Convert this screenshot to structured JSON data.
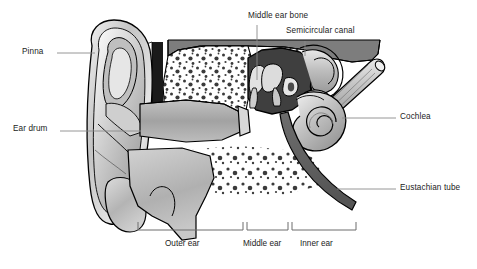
{
  "diagram": {
    "style": "grayscale anatomical illustration",
    "colors": {
      "outline": "#000000",
      "cranial_band": "#7d7d7d",
      "bone_fill": "#ffffff",
      "tissue_light": "#c9c9c9",
      "tissue_mid": "#a8a8a8",
      "cavity_dark": "#4a4a4a",
      "leader_line": "#8a8a8a",
      "text": "#1b1b1b",
      "background": "#ffffff"
    },
    "labels": [
      {
        "id": "pinna",
        "text": "Pinna",
        "x": 22,
        "y": 48,
        "anchor": "left"
      },
      {
        "id": "ear-drum",
        "text": "Ear drum",
        "x": 13,
        "y": 125,
        "anchor": "left"
      },
      {
        "id": "middle-ear-bone",
        "text": "Middle ear bone",
        "x": 248,
        "y": 12,
        "anchor": "top"
      },
      {
        "id": "semicircular-canal",
        "text": "Semicircular canal",
        "x": 286,
        "y": 27,
        "anchor": "top"
      },
      {
        "id": "cochlea",
        "text": "Cochlea",
        "x": 400,
        "y": 113,
        "anchor": "right"
      },
      {
        "id": "eustachian-tube",
        "text": "Eustachian tube",
        "x": 400,
        "y": 184,
        "anchor": "right"
      }
    ],
    "brackets": [
      {
        "id": "outer-ear",
        "text": "Outer ear",
        "x1": 138,
        "x2": 243,
        "label_x": 165,
        "label_y": 239
      },
      {
        "id": "middle-ear",
        "text": "Middle ear",
        "x1": 247,
        "x2": 288,
        "label_x": 243,
        "label_y": 239
      },
      {
        "id": "inner-ear",
        "text": "Inner ear",
        "x1": 292,
        "x2": 356,
        "label_x": 300,
        "label_y": 239
      }
    ],
    "bracket_baseline_y": 230,
    "parts": [
      "pinna",
      "ear canal",
      "ear drum",
      "ossicles",
      "middle ear cavity",
      "semicircular canals",
      "cochlea",
      "auditory nerve",
      "eustachian tube",
      "mastoid air cells",
      "ear lobe"
    ]
  }
}
